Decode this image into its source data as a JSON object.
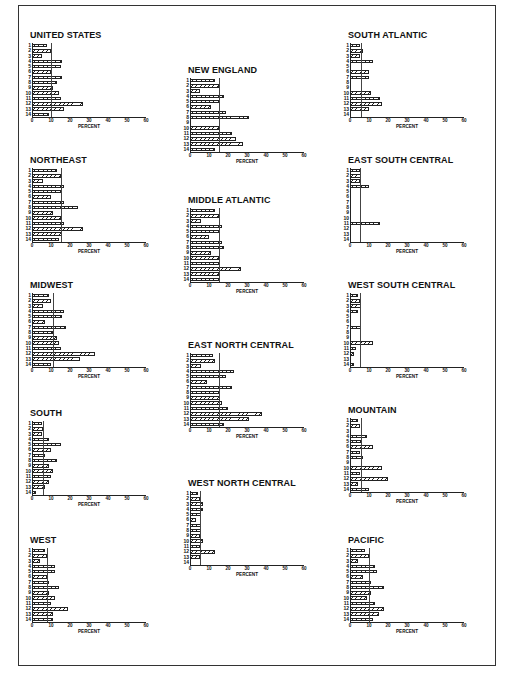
{
  "chart_data": [
    {
      "type": "bar",
      "title": "UNITED STATES",
      "categories": [
        "1",
        "2",
        "3",
        "4",
        "5",
        "6",
        "7",
        "8",
        "9",
        "10",
        "11",
        "12",
        "13",
        "14"
      ],
      "values": [
        8,
        10,
        5,
        16,
        15,
        10,
        16,
        13,
        11,
        14,
        15,
        27,
        17,
        9
      ],
      "reference_line": 10,
      "xlabel": "PERCENT",
      "ylabel": "",
      "xlim": [
        0,
        60
      ],
      "xticks": [
        0,
        10,
        20,
        30,
        40,
        50,
        60
      ],
      "orientation": "horizontal"
    },
    {
      "type": "bar",
      "title": "NORTHEAST",
      "categories": [
        "1",
        "2",
        "3",
        "4",
        "5",
        "6",
        "7",
        "8",
        "9",
        "10",
        "11",
        "12",
        "13",
        "14"
      ],
      "values": [
        13,
        15,
        6,
        17,
        15,
        10,
        17,
        24,
        11,
        15,
        17,
        27,
        16,
        14
      ],
      "reference_line": 15,
      "xlabel": "PERCENT",
      "ylabel": "",
      "xlim": [
        0,
        60
      ],
      "xticks": [
        0,
        10,
        20,
        30,
        40,
        50,
        60
      ],
      "orientation": "horizontal"
    },
    {
      "type": "bar",
      "title": "MIDWEST",
      "categories": [
        "1",
        "2",
        "3",
        "4",
        "5",
        "6",
        "7",
        "8",
        "9",
        "10",
        "11",
        "12",
        "13",
        "14"
      ],
      "values": [
        9,
        10,
        6,
        17,
        16,
        7,
        18,
        11,
        13,
        14,
        15,
        33,
        25,
        10
      ],
      "reference_line": 11,
      "xlabel": "PERCENT",
      "ylabel": "",
      "xlim": [
        0,
        60
      ],
      "xticks": [
        0,
        10,
        20,
        30,
        40,
        50,
        60
      ],
      "orientation": "horizontal"
    },
    {
      "type": "bar",
      "title": "SOUTH",
      "categories": [
        "1",
        "2",
        "3",
        "4",
        "5",
        "6",
        "7",
        "8",
        "9",
        "10",
        "11",
        "12",
        "13",
        "14"
      ],
      "values": [
        5,
        6,
        5,
        9,
        15,
        10,
        7,
        13,
        9,
        11,
        10,
        9,
        7,
        2
      ],
      "reference_line": 6,
      "xlabel": "PERCENT",
      "ylabel": "",
      "xlim": [
        0,
        60
      ],
      "xticks": [
        0,
        10,
        20,
        30,
        40,
        50,
        60
      ],
      "orientation": "horizontal"
    },
    {
      "type": "bar",
      "title": "WEST",
      "categories": [
        "1",
        "2",
        "3",
        "4",
        "5",
        "6",
        "7",
        "8",
        "9",
        "10",
        "11",
        "12",
        "13",
        "14"
      ],
      "values": [
        7,
        8,
        4,
        12,
        12,
        8,
        9,
        14,
        9,
        12,
        10,
        19,
        11,
        11
      ],
      "reference_line": 8,
      "xlabel": "PERCENT",
      "ylabel": "",
      "xlim": [
        0,
        60
      ],
      "xticks": [
        0,
        10,
        20,
        30,
        40,
        50,
        60
      ],
      "orientation": "horizontal"
    },
    {
      "type": "bar",
      "title": "NEW ENGLAND",
      "categories": [
        "1",
        "2",
        "3",
        "4",
        "5",
        "6",
        "7",
        "8",
        "9",
        "10",
        "11",
        "12",
        "13",
        "14"
      ],
      "values": [
        13,
        15,
        5,
        18,
        15,
        11,
        19,
        31,
        0,
        15,
        22,
        24,
        28,
        13
      ],
      "reference_line": 15,
      "xlabel": "PERCENT",
      "ylabel": "",
      "xlim": [
        0,
        60
      ],
      "xticks": [
        0,
        10,
        20,
        30,
        40,
        50,
        60
      ],
      "orientation": "horizontal"
    },
    {
      "type": "bar",
      "title": "MIDDLE ATLANTIC",
      "categories": [
        "1",
        "2",
        "3",
        "4",
        "5",
        "6",
        "7",
        "8",
        "9",
        "10",
        "11",
        "12",
        "13",
        "14"
      ],
      "values": [
        13,
        15,
        6,
        17,
        16,
        10,
        17,
        18,
        11,
        15,
        16,
        27,
        15,
        15
      ],
      "reference_line": 15,
      "xlabel": "PERCENT",
      "ylabel": "",
      "xlim": [
        0,
        60
      ],
      "xticks": [
        0,
        10,
        20,
        30,
        40,
        50,
        60
      ],
      "orientation": "horizontal"
    },
    {
      "type": "bar",
      "title": "EAST NORTH CENTRAL",
      "categories": [
        "1",
        "2",
        "3",
        "4",
        "5",
        "6",
        "7",
        "8",
        "9",
        "10",
        "11",
        "12",
        "13",
        "14"
      ],
      "values": [
        12,
        13,
        6,
        23,
        19,
        9,
        22,
        16,
        16,
        17,
        20,
        38,
        31,
        18
      ],
      "reference_line": 15,
      "xlabel": "PERCENT",
      "ylabel": "",
      "xlim": [
        0,
        60
      ],
      "xticks": [
        0,
        10,
        20,
        30,
        40,
        50,
        60
      ],
      "orientation": "horizontal"
    },
    {
      "type": "bar",
      "title": "WEST NORTH CENTRAL",
      "categories": [
        "1",
        "2",
        "3",
        "4",
        "5",
        "6",
        "7",
        "8",
        "9",
        "10",
        "11",
        "12",
        "13",
        "14"
      ],
      "values": [
        4,
        5,
        7,
        7,
        6,
        3,
        6,
        6,
        5,
        7,
        5,
        13,
        5,
        0
      ],
      "reference_line": 5,
      "xlabel": "PERCENT",
      "ylabel": "",
      "xlim": [
        0,
        60
      ],
      "xticks": [
        0,
        10,
        20,
        30,
        40,
        50,
        60
      ],
      "orientation": "horizontal"
    },
    {
      "type": "bar",
      "title": "SOUTH ATLANTIC",
      "categories": [
        "1",
        "2",
        "3",
        "4",
        "5",
        "6",
        "7",
        "8",
        "9",
        "10",
        "11",
        "12",
        "13",
        "14"
      ],
      "values": [
        5,
        7,
        5,
        12,
        0,
        10,
        10,
        0,
        0,
        11,
        16,
        17,
        10,
        0
      ],
      "reference_line": 6,
      "xlabel": "PERCENT",
      "ylabel": "",
      "xlim": [
        0,
        60
      ],
      "xticks": [
        0,
        10,
        20,
        30,
        40,
        50,
        60
      ],
      "orientation": "horizontal"
    },
    {
      "type": "bar",
      "title": "EAST SOUTH CENTRAL",
      "categories": [
        "1",
        "2",
        "3",
        "4",
        "5",
        "6",
        "7",
        "8",
        "9",
        "10",
        "11",
        "12",
        "13",
        "14"
      ],
      "values": [
        5,
        6,
        5,
        10,
        0,
        0,
        0,
        0,
        0,
        0,
        16,
        0,
        0,
        0
      ],
      "reference_line": 5,
      "xlabel": "PERCENT",
      "ylabel": "",
      "xlim": [
        0,
        60
      ],
      "xticks": [
        0,
        10,
        20,
        30,
        40,
        50,
        60
      ],
      "orientation": "horizontal"
    },
    {
      "type": "bar",
      "title": "WEST SOUTH CENTRAL",
      "categories": [
        "1",
        "2",
        "3",
        "4",
        "5",
        "6",
        "7",
        "8",
        "9",
        "10",
        "11",
        "12",
        "13",
        "14"
      ],
      "values": [
        4,
        5,
        6,
        4,
        0,
        0,
        6,
        0,
        0,
        12,
        3,
        2,
        0,
        2
      ],
      "reference_line": 5,
      "xlabel": "PERCENT",
      "ylabel": "",
      "xlim": [
        0,
        60
      ],
      "xticks": [
        0,
        10,
        20,
        30,
        40,
        50,
        60
      ],
      "orientation": "horizontal"
    },
    {
      "type": "bar",
      "title": "MOUNTAIN",
      "categories": [
        "1",
        "2",
        "3",
        "4",
        "5",
        "6",
        "7",
        "8",
        "9",
        "10",
        "11",
        "12",
        "13",
        "14"
      ],
      "values": [
        4,
        5,
        0,
        9,
        6,
        12,
        5,
        7,
        0,
        17,
        5,
        20,
        4,
        10
      ],
      "reference_line": 6,
      "xlabel": "PERCENT",
      "ylabel": "",
      "xlim": [
        0,
        60
      ],
      "xticks": [
        0,
        10,
        20,
        30,
        40,
        50,
        60
      ],
      "orientation": "horizontal"
    },
    {
      "type": "bar",
      "title": "PACIFIC",
      "categories": [
        "1",
        "2",
        "3",
        "4",
        "5",
        "6",
        "7",
        "8",
        "9",
        "10",
        "11",
        "12",
        "13",
        "14"
      ],
      "values": [
        8,
        10,
        4,
        13,
        14,
        7,
        11,
        18,
        11,
        9,
        13,
        18,
        15,
        12
      ],
      "reference_line": 10,
      "xlabel": "PERCENT",
      "ylabel": "",
      "xlim": [
        0,
        60
      ],
      "xticks": [
        0,
        10,
        20,
        30,
        40,
        50,
        60
      ],
      "orientation": "horizontal"
    }
  ],
  "layout": {
    "panel_positions": [
      {
        "left": 20,
        "top": 30
      },
      {
        "left": 20,
        "top": 155
      },
      {
        "left": 20,
        "top": 280
      },
      {
        "left": 20,
        "top": 408
      },
      {
        "left": 20,
        "top": 535
      },
      {
        "left": 178,
        "top": 65
      },
      {
        "left": 178,
        "top": 195
      },
      {
        "left": 178,
        "top": 340
      },
      {
        "left": 178,
        "top": 478
      },
      {
        "left": 338,
        "top": 30
      },
      {
        "left": 338,
        "top": 155
      },
      {
        "left": 338,
        "top": 280
      },
      {
        "left": 338,
        "top": 405
      },
      {
        "left": 338,
        "top": 535
      }
    ]
  }
}
